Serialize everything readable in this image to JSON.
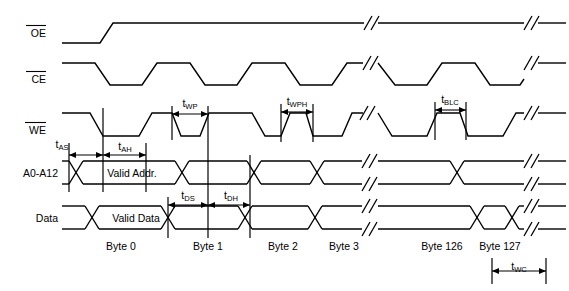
{
  "figure": {
    "type": "timing-diagram",
    "width": 569,
    "height": 291,
    "background": "#ffffff",
    "line_color": "#000000"
  },
  "signals": [
    {
      "id": "oe",
      "name": "OE",
      "overline": true,
      "label": "OE",
      "row_top": 23,
      "row_bottom": 43
    },
    {
      "id": "ce",
      "name": "CE",
      "overline": true,
      "label": "CE",
      "row_top": 63,
      "row_bottom": 85
    },
    {
      "id": "we",
      "name": "WE",
      "overline": true,
      "label": "WE",
      "row_top": 113,
      "row_bottom": 136
    },
    {
      "id": "addr",
      "name": "A0-A12",
      "overline": false,
      "label": "A0-A12",
      "row_top": 161,
      "row_bottom": 184
    },
    {
      "id": "data",
      "name": "Data",
      "overline": false,
      "label": "Data",
      "row_top": 206,
      "row_bottom": 229
    }
  ],
  "bus_values": [
    {
      "id": "valid-addr",
      "label": "Valid Addr.",
      "signal": "A0-A12",
      "x_center": 132
    },
    {
      "id": "valid-data",
      "label": "Valid Data",
      "signal": "Data",
      "x_center": 136
    }
  ],
  "timing_params": [
    {
      "id": "tas",
      "base": "t",
      "sub": "AS",
      "label": "tAS",
      "x_start": 69,
      "x_end": 103,
      "text_x": 62,
      "text_y": 146
    },
    {
      "id": "tah",
      "base": "t",
      "sub": "AH",
      "label": "tAH",
      "x_start": 103,
      "x_end": 146,
      "text_x": 125,
      "text_y": 150
    },
    {
      "id": "twp",
      "base": "t",
      "sub": "WP",
      "label": "tWP",
      "x_start": 172,
      "x_end": 208,
      "text_x": 190,
      "text_y": 104
    },
    {
      "id": "tds",
      "base": "t",
      "sub": "DS",
      "label": "tDS",
      "x_start": 168,
      "x_end": 212,
      "text_x": 190,
      "text_y": 200
    },
    {
      "id": "tdh",
      "base": "t",
      "sub": "DH",
      "label": "tDH",
      "x_start": 212,
      "x_end": 250,
      "text_x": 231,
      "text_y": 200
    },
    {
      "id": "twph",
      "base": "t",
      "sub": "WPH",
      "label": "tWPH",
      "x_start": 281,
      "x_end": 313,
      "text_x": 297,
      "text_y": 102
    },
    {
      "id": "tblc",
      "base": "t",
      "sub": "BLC",
      "label": "tBLC",
      "x_start": 435,
      "x_end": 466,
      "text_x": 450,
      "text_y": 100
    },
    {
      "id": "twc",
      "base": "t",
      "sub": "WC",
      "label": "tWC",
      "x_start": 492,
      "x_end": 546,
      "text_x": 519,
      "text_y": 272
    }
  ],
  "byte_labels": [
    {
      "id": "byte-0",
      "text": "Byte 0",
      "x": 121
    },
    {
      "id": "byte-1",
      "text": "Byte 1",
      "x": 208
    },
    {
      "id": "byte-2",
      "text": "Byte 2",
      "x": 283
    },
    {
      "id": "byte-3",
      "text": "Byte 3",
      "x": 344
    },
    {
      "id": "byte-126",
      "text": "Byte 126",
      "x": 442
    },
    {
      "id": "byte-127",
      "text": "Byte 127",
      "x": 500
    }
  ],
  "byte_label_row_y": 248,
  "break_marks": {
    "description": "double-slash waveform break symbols",
    "x_positions": [
      370,
      530
    ],
    "rows": [
      "OE",
      "CE",
      "WE",
      "A0-A12",
      "Data"
    ]
  }
}
